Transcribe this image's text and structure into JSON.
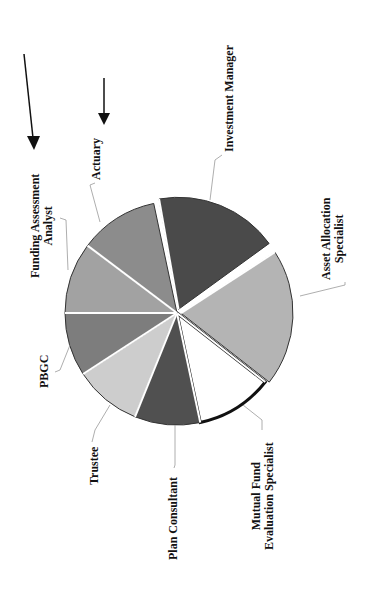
{
  "chart_data": {
    "type": "pie",
    "title": "",
    "orientation": "rotated 90 degrees counterclockwise",
    "slices": [
      {
        "label": "Investment Manager",
        "start_deg": -100,
        "end_deg": -36,
        "color": "#4a4a4a",
        "exploded": true
      },
      {
        "label": "Asset Allocation Specialist",
        "start_deg": -33,
        "end_deg": 38,
        "color": "#b4b4b4",
        "exploded": true
      },
      {
        "label": "Mutual Fund Evaluation Specialist",
        "start_deg": 38,
        "end_deg": 78,
        "color": "#ffffff",
        "exploded": false,
        "highlighted": true
      },
      {
        "label": "Plan Consultant",
        "start_deg": 78,
        "end_deg": 112,
        "color": "#505050",
        "exploded": false
      },
      {
        "label": "Trustee",
        "start_deg": 112,
        "end_deg": 147,
        "color": "#cdcdcd",
        "exploded": false
      },
      {
        "label": "PBGC",
        "start_deg": 147,
        "end_deg": 180,
        "color": "#7d7d7d",
        "exploded": false
      },
      {
        "label": "Funding Assessment Analyst",
        "start_deg": 180,
        "end_deg": 217,
        "color": "#a2a2a2",
        "exploded": false
      },
      {
        "label": "Actuary",
        "start_deg": 217,
        "end_deg": 258,
        "color": "#8c8c8c",
        "exploded": false
      }
    ],
    "annotations": [
      "arrow pointing to Funding Assessment Analyst",
      "arrow pointing to Actuary"
    ]
  },
  "labels": {
    "investment_manager": "Investment Manager",
    "asset_allocation_1": "Asset Allocation",
    "asset_allocation_2": "Specialist",
    "mutual_fund_1": "Mutual Fund",
    "mutual_fund_2": "Evaluation Specialist",
    "plan_consultant": "Plan Consultant",
    "trustee": "Trustee",
    "pbgc": "PBGC",
    "funding_1": "Funding Assessment",
    "funding_2": "Analyst",
    "actuary": "Actuary"
  }
}
